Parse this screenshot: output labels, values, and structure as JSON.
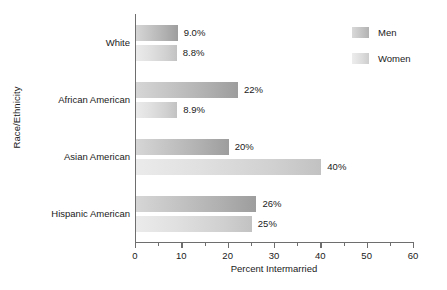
{
  "chart_data": {
    "type": "bar",
    "orientation": "horizontal",
    "title": "",
    "xlabel": "Percent Intermarried",
    "ylabel": "Race/Ethnicity",
    "xlim": [
      0,
      60
    ],
    "xticks": [
      0,
      10,
      20,
      30,
      40,
      50,
      60
    ],
    "xtick_labels": [
      "0",
      "10",
      "20",
      "30",
      "40",
      "50",
      "60"
    ],
    "minor_tick_interval": 5,
    "grid": false,
    "legend_position": "top-right",
    "categories": [
      "White",
      "African American",
      "Asian American",
      "Hispanic American"
    ],
    "series": [
      {
        "name": "Men",
        "values": [
          9.0,
          22,
          20,
          26
        ],
        "labels": [
          "9.0%",
          "22%",
          "20%",
          "26%"
        ],
        "color": "#b6b6b6"
      },
      {
        "name": "Women",
        "values": [
          8.8,
          8.9,
          40,
          25
        ],
        "labels": [
          "8.8%",
          "8.9%",
          "40%",
          "25%"
        ],
        "color": "#dedede"
      }
    ]
  },
  "axes": {
    "y_title": "Race/Ethnicity",
    "x_title": "Percent Intermarried"
  },
  "legend": {
    "items": [
      {
        "label": "Men"
      },
      {
        "label": "Women"
      }
    ]
  }
}
